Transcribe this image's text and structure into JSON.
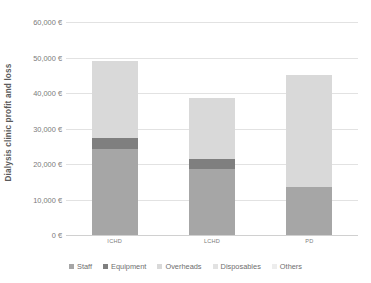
{
  "chart_data": {
    "type": "bar",
    "subtype": "stacked-column",
    "title": "",
    "xlabel": "",
    "ylabel": "Dialysis clinic profit and loss",
    "categories": [
      "ICHD",
      "LCHD",
      "PD"
    ],
    "ylim": [
      0,
      60000
    ],
    "ytick_values": [
      0,
      10000,
      20000,
      30000,
      40000,
      50000,
      60000
    ],
    "ytick_labels": [
      "0 €",
      "10,000 €",
      "20,000 €",
      "30,000 €",
      "40,000 €",
      "50,000 €",
      "60,000 €"
    ],
    "currency_symbol": "€",
    "grid": true,
    "legend_position": "bottom",
    "series": [
      {
        "name": "Staff",
        "color": "#a6a6a6",
        "values": [
          24200,
          18600,
          13400
        ]
      },
      {
        "name": "Equipment",
        "color": "#7f7f7f",
        "values": [
          3100,
          2700,
          0
        ]
      },
      {
        "name": "Overheads",
        "color": "#d9d9d9",
        "values": [
          21700,
          17200,
          31600
        ]
      },
      {
        "name": "Disposables",
        "color": "#e8e8e8",
        "values": [
          0,
          0,
          0
        ]
      },
      {
        "name": "Others",
        "color": "#efefef",
        "values": [
          0,
          0,
          0
        ]
      }
    ],
    "totals": [
      49000,
      38500,
      45000
    ]
  },
  "legend": {
    "items": [
      {
        "label": "Staff",
        "color": "#a6a6a6"
      },
      {
        "label": "Equipment",
        "color": "#7f7f7f"
      },
      {
        "label": "Overheads",
        "color": "#d9d9d9"
      },
      {
        "label": "Disposables",
        "color": "#e2e2e2"
      },
      {
        "label": "Others",
        "color": "#ededed"
      }
    ]
  }
}
